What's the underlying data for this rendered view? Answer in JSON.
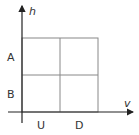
{
  "diagram": {
    "axes": {
      "y_label": "h",
      "x_label": "v"
    },
    "row_labels": [
      "A",
      "B"
    ],
    "column_labels": [
      "U",
      "D"
    ],
    "grid": {
      "rows": 2,
      "columns": 2
    },
    "colors": {
      "axis": "#222222",
      "grid": "#888888",
      "text": "#333333"
    }
  }
}
